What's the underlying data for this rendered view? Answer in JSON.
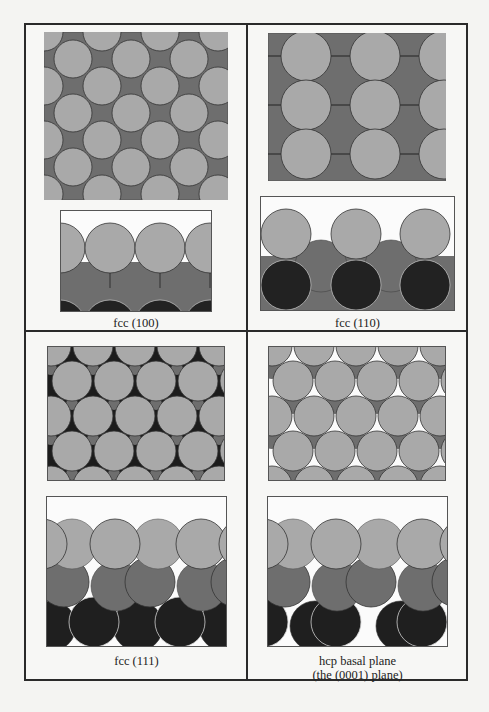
{
  "figure": {
    "colors": {
      "top_layer": "#a9a9a9",
      "second_layer": "#6e6e6e",
      "third_layer": "#222222",
      "background_white": "#fbfbfb",
      "outline": "#3a3a3a",
      "frame": "#2a2a2a"
    },
    "panels": [
      {
        "id": "fcc100",
        "caption_line1": "fcc (100)",
        "caption_line2": "",
        "top_view": "square lattice, 2nd layer visible in hollows",
        "side_view": "top layer over 2nd layer, 3rd layer bottom"
      },
      {
        "id": "fcc110",
        "caption_line1": "fcc (110)",
        "caption_line2": "",
        "top_view": "rectangular rows of atoms over 2nd layer",
        "side_view": "row atoms over 2nd and 3rd layers"
      },
      {
        "id": "fcc111",
        "caption_line1": "fcc (111)",
        "caption_line2": "",
        "top_view": "hexagonal close packed, ABC stacking",
        "side_view": "three layers A/B/C"
      },
      {
        "id": "hcp0001",
        "caption_line1": "hcp basal plane",
        "caption_line2": "(the (0001) plane)",
        "top_view": "hexagonal close packed, ABAB stacking",
        "side_view": "three layers A/B/A"
      }
    ]
  }
}
